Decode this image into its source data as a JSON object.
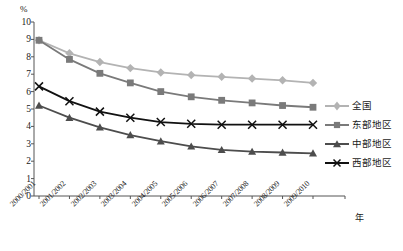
{
  "chart_data": {
    "type": "line",
    "title": "",
    "xlabel": "年",
    "ylabel": "%",
    "unit_label": "%",
    "grid": false,
    "legend_position": "right",
    "ylim": [
      0,
      10
    ],
    "yticks": [
      0,
      1,
      2,
      3,
      4,
      5,
      6,
      7,
      8,
      9,
      10
    ],
    "categories": [
      "2000/2001",
      "2001/2002",
      "2002/2003",
      "2003/2004",
      "2004/2005",
      "2005/2006",
      "2006/2007",
      "2007/2008",
      "2008/2009",
      "2009/2010"
    ],
    "series": [
      {
        "name": "全国",
        "marker": "diamond",
        "color": "#b3b3b3",
        "values": [
          8.95,
          8.2,
          7.7,
          7.35,
          7.1,
          6.95,
          6.85,
          6.75,
          6.65,
          6.5
        ]
      },
      {
        "name": "东部地区",
        "marker": "square",
        "color": "#7a7a7a",
        "values": [
          8.95,
          7.85,
          7.05,
          6.5,
          6.0,
          5.7,
          5.5,
          5.35,
          5.2,
          5.1
        ]
      },
      {
        "name": "中部地区",
        "marker": "triangle",
        "color": "#4d4d4d",
        "values": [
          5.2,
          4.5,
          3.95,
          3.5,
          3.15,
          2.85,
          2.65,
          2.55,
          2.5,
          2.45
        ]
      },
      {
        "name": "西部地区",
        "marker": "cross",
        "color": "#111111",
        "values": [
          6.3,
          5.45,
          4.85,
          4.5,
          4.25,
          4.15,
          4.1,
          4.1,
          4.1,
          4.1
        ]
      }
    ]
  },
  "legend": {
    "items": [
      {
        "label": "全国"
      },
      {
        "label": "东部地区"
      },
      {
        "label": "中部地区"
      },
      {
        "label": "西部地区"
      }
    ]
  },
  "axis": {
    "unit": "%",
    "x_title": "年"
  },
  "colors": {
    "national": "#b3b3b3",
    "east": "#7a7a7a",
    "central": "#4d4d4d",
    "west": "#111111",
    "axis": "#555555",
    "text": "#1a1a1a"
  }
}
